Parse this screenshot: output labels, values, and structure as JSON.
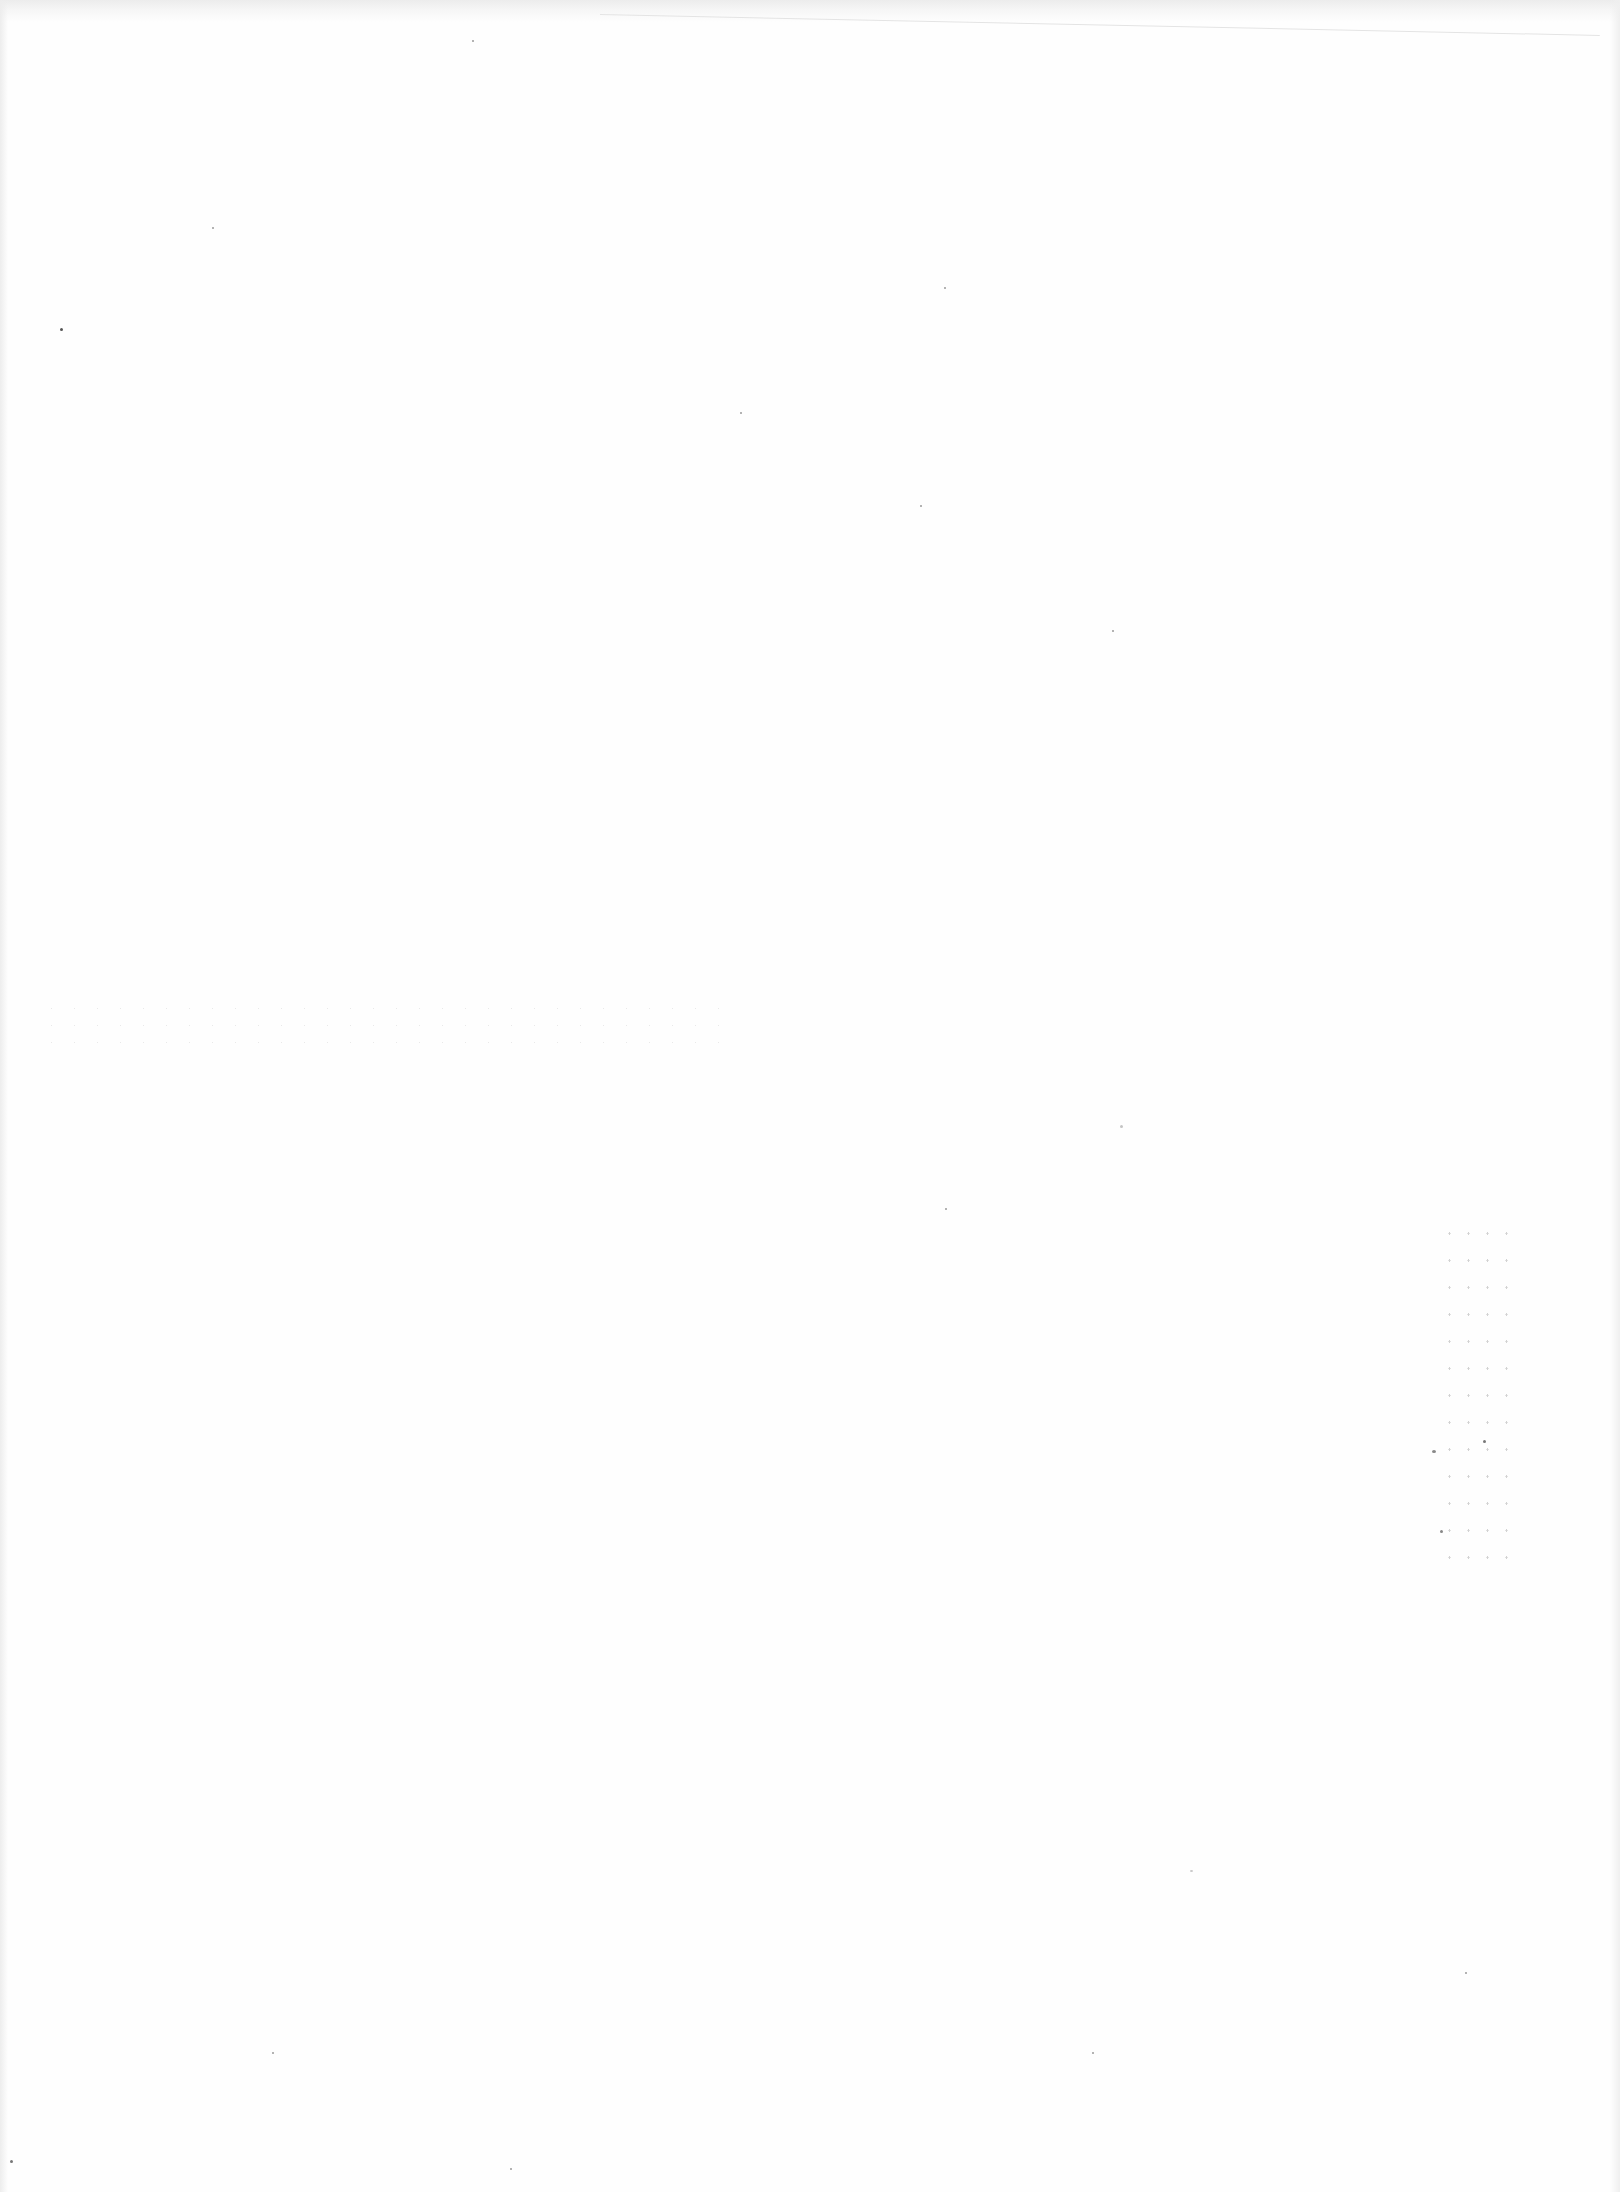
{
  "page": {
    "type": "blank-scanned-page",
    "content": "",
    "background_color": "#fefefe",
    "edge_shading_color": "#ececec"
  }
}
